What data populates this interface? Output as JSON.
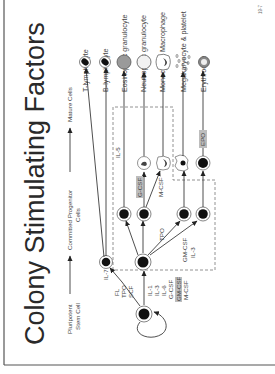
{
  "slide": {
    "title": "Colony Stimulating Factors",
    "page_number": "19-7",
    "stage_labels": {
      "stem_line1": "Pluripotent",
      "stem_line2": "Stem Cell",
      "progenitor_line1": "Committed Progenitor",
      "progenitor_line2": "Cells",
      "mature": "Mature Cells"
    },
    "mature_cells": [
      {
        "name": "T-lymphocyte"
      },
      {
        "name": "B-lymphocyte"
      },
      {
        "name": "Eosinophilic granulocyte"
      },
      {
        "name": "Neutrophilic granulocyte"
      },
      {
        "name": "Monocyte & Macrophage"
      },
      {
        "name": "Megakaryocyte & platelet"
      },
      {
        "name": "Erythrocyte"
      }
    ],
    "factors": {
      "il7": "IL-7",
      "stem_group1": [
        "FL",
        "TPO",
        "SCF"
      ],
      "stem_group2": [
        "IL-1",
        "IL-3",
        "IL-6",
        "G-CSF",
        "GM-CSF",
        "M-CSF"
      ],
      "il5": "IL-5",
      "gcsf": "G-CSF",
      "mcsf": "M-CSF",
      "tpo": "TPO",
      "gmcsf": "GM-CSF",
      "il3": "IL-3",
      "epo": "EPO"
    },
    "colors": {
      "highlight": "#bdbdbd",
      "cell_fill": "#111111",
      "eosinophil_fill": "#9a9a9a",
      "border": "#555555"
    }
  }
}
